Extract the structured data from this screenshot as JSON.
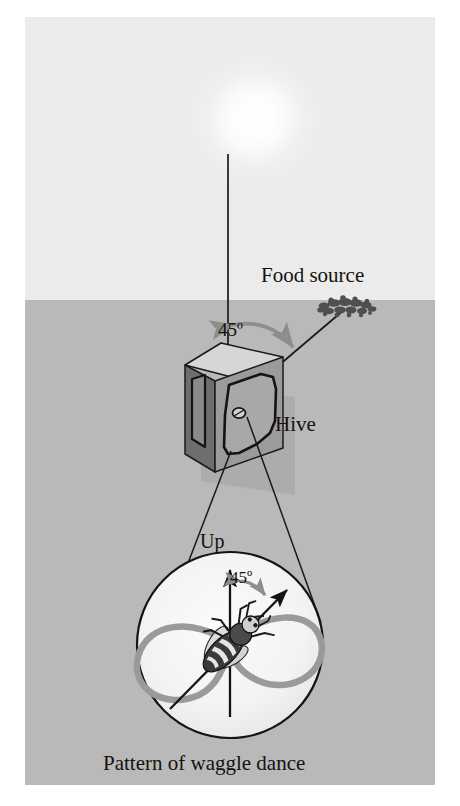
{
  "figure": {
    "caption": "Pattern of waggle dance",
    "labels": {
      "food_source": "Food source",
      "hive": "Hive",
      "up": "Up",
      "angle_field": "45º",
      "angle_dance": "45º"
    },
    "icons": {
      "sun": "sun-icon",
      "hive_box": "hive-box-icon",
      "bee": "bee-icon",
      "food_cluster": "food-cluster-icon",
      "comb": "honeycomb-icon"
    },
    "colors": {
      "sky": "#ebebeb",
      "ground": "#b9b9b9",
      "plate": "#ececec",
      "ink": "#15120f",
      "arrow_grey": "#8d8d8d",
      "dance_loop": "#9a9a9a",
      "dance_disc": "#f2f2f2",
      "hive_top": "#d2d2d2",
      "hive_front": "#9b9b9b",
      "hive_side": "#6f6f6f"
    },
    "geometry": {
      "sun_angle_deg": 45,
      "dance_angle_deg": 45,
      "horizon_y": 300,
      "sun_cx": 230,
      "sun_cy": 100,
      "hive_cx": 228,
      "hive_cy": 395,
      "dance_cx": 228,
      "dance_cy": 645,
      "dance_r": 93
    }
  }
}
